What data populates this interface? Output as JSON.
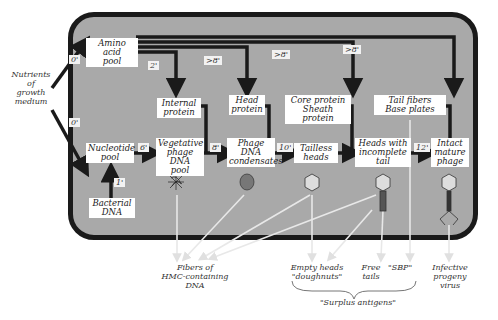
{
  "diagram": {
    "external_inputs": {
      "nutrients_label": "Nutrients\nof\ngrowth\nmedium"
    },
    "pools": {
      "amino_acid": "Amino acid\npool",
      "nucleotide": "Nucleotide\npool",
      "bacterial_dna": "Bacterial\nDNA"
    },
    "proteins": {
      "internal": "Internal\nprotein",
      "head": "Head\nprotein",
      "core_sheath": "Core protein\nSheath protein",
      "tail_base": "Tail fibers\nBase plates"
    },
    "assembly_stages": {
      "vegetative_dna": "Vegetative\nphage DNA\npool",
      "dna_condensates": "Phage\nDNA\ncondensates",
      "tailless_heads": "Tailless\nheads",
      "heads_incomplete_tail": "Heads with\nincomplete\ntail",
      "intact_phage": "Intact\nmature\nphage"
    },
    "time_labels": {
      "amino_in": "0'",
      "nucleotide_in": "0'",
      "internal_protein": "2'",
      "head_protein": ">8'",
      "core_protein": ">8'",
      "tail_fibers": ">8'",
      "veg_dna": "6'",
      "condensates": "8'",
      "tailless": "10'",
      "intact": "12'",
      "bacterial_dna": "1'"
    },
    "products": {
      "fibers_dna": "Fibers of\nHMC-containing\nDNA",
      "empty_heads": "Empty heads\n\"doughnuts\"",
      "free_tails": "Free\ntails",
      "sbp": "\"SBP\"",
      "infective_virus": "Infective\nprogeny\nvirus",
      "surplus_antigens": "\"Surplus antigens\""
    },
    "colors": {
      "cell_fill": "#a9a9a9",
      "cell_border": "#1a1a1a",
      "arrow": "#1a1a1a",
      "product_arrow": "#e8e8e8"
    }
  }
}
